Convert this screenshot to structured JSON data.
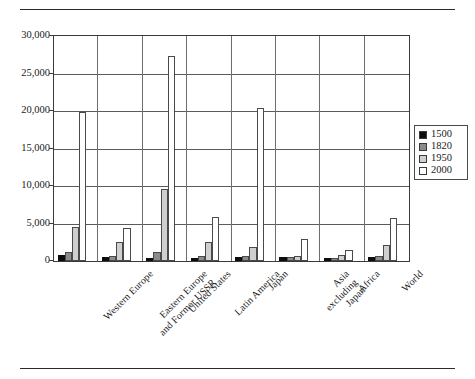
{
  "chart_data": {
    "type": "bar",
    "title": "",
    "subtitle": "",
    "xlabel": "",
    "ylabel": "",
    "ylim": [
      0,
      30000
    ],
    "ytick_labels": [
      "0",
      "5,000",
      "10,000",
      "15,000",
      "20,000",
      "25,000",
      "30,000"
    ],
    "ytick_values": [
      0,
      5000,
      10000,
      15000,
      20000,
      25000,
      30000
    ],
    "grid": true,
    "legend_position": "right",
    "categories": [
      "Western Europe",
      "Eastern Europe\nand Former USSR",
      "United States",
      "Latin America",
      "Japan",
      "Asia\nexcluding\nJapan",
      "Africa",
      "World"
    ],
    "series": [
      {
        "name": "1500",
        "color": "#0d0d0d",
        "values": [
          771,
          500,
          400,
          416,
          500,
          572,
          414,
          566
        ]
      },
      {
        "name": "1820",
        "color": "#8c8c8c",
        "values": [
          1202,
          683,
          1257,
          692,
          669,
          577,
          420,
          667
        ]
      },
      {
        "name": "1950",
        "color": "#cfcfcf",
        "values": [
          4579,
          2602,
          9561,
          2510,
          1921,
          635,
          852,
          2111
        ]
      },
      {
        "name": "2000",
        "color": "#ffffff",
        "values": [
          19806,
          4354,
          27272,
          5889,
          20413,
          2936,
          1464,
          5709
        ]
      }
    ]
  },
  "legend": {
    "items": [
      {
        "label": "1500",
        "swatch": "#0d0d0d"
      },
      {
        "label": "1820",
        "swatch": "#8c8c8c"
      },
      {
        "label": "1950",
        "swatch": "#cfcfcf"
      },
      {
        "label": "2000",
        "swatch": "#ffffff"
      }
    ]
  }
}
